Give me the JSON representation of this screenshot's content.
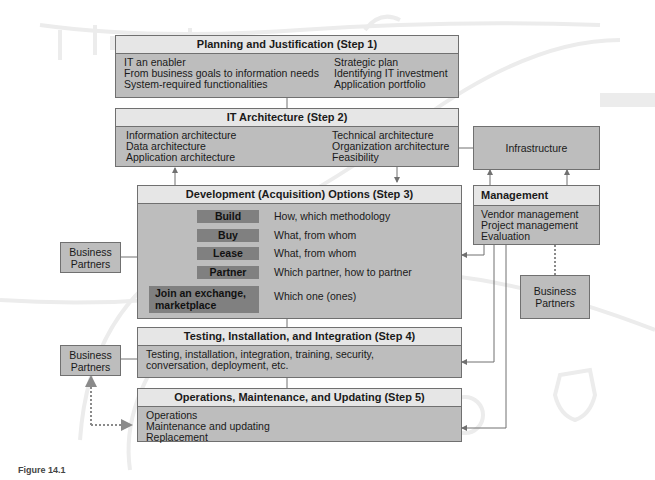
{
  "figure": {
    "caption": "Figure 14.1"
  },
  "steps": [
    {
      "title": "Planning and Justification (Step 1)",
      "left_items": [
        "IT an enabler",
        "From business goals to information needs",
        "System-required functionalities"
      ],
      "right_items": [
        "Strategic plan",
        "Identifying IT investment",
        "Application portfolio"
      ]
    },
    {
      "title": "IT Architecture (Step 2)",
      "left_items": [
        "Information architecture",
        "Data architecture",
        "Application architecture"
      ],
      "right_items": [
        "Technical architecture",
        "Organization architecture",
        "Feasibility"
      ]
    },
    {
      "title": "Development (Acquisition) Options (Step 3)",
      "options": [
        {
          "label": "Build",
          "description": "How, which methodology"
        },
        {
          "label": "Buy",
          "description": "What, from whom"
        },
        {
          "label": "Lease",
          "description": "What, from whom"
        },
        {
          "label": "Partner",
          "description": "Which partner, how to partner"
        },
        {
          "label": "Join an exchange, marketplace",
          "description": "Which one (ones)"
        }
      ]
    },
    {
      "title": "Testing, Installation, and Integration (Step 4)",
      "items": [
        "Testing, installation, integration, training, security,",
        "conversation, deployment, etc."
      ]
    },
    {
      "title": "Operations, Maintenance, and Updating (Step 5)",
      "items": [
        "Operations",
        "Maintenance and updating",
        "Replacement"
      ]
    }
  ],
  "infrastructure": {
    "label": "Infrastructure"
  },
  "management": {
    "title": "Management",
    "items": [
      "Vendor management",
      "Project management",
      "Evaluation"
    ]
  },
  "business_partners": [
    {
      "label": "Business Partners",
      "position": "left-step3"
    },
    {
      "label": "Business Partners",
      "position": "left-step4"
    },
    {
      "label": "Business Partners",
      "position": "right-management"
    }
  ],
  "colors": {
    "box_fill": "#bdbdbd",
    "header_fill": "#e6e6e6",
    "option_fill": "#808080",
    "connector": "#707070",
    "dotted_connector": "#8a8a8a"
  }
}
